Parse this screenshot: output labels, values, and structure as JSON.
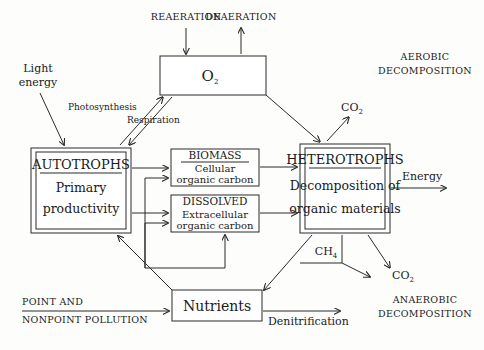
{
  "diagram": {
    "boxes": {
      "oxygen": {
        "label": "O",
        "subscript": "2"
      },
      "autotrophs": {
        "title": "AUTOTROPHS",
        "line1": "Primary",
        "line2": "productivity"
      },
      "biomass": {
        "title": "BIOMASS",
        "line1": "Cellular",
        "line2": "organic carbon"
      },
      "dissolved": {
        "title": "DISSOLVED",
        "line1": "Extracellular",
        "line2": "organic carbon"
      },
      "heterotrophs": {
        "title": "HETEROTROPHS",
        "line1": "Decomposition of",
        "line2": "organic materials"
      },
      "nutrients": {
        "label": "Nutrients"
      }
    },
    "flow_labels": {
      "reaeration": "REAERATION",
      "deaeration": "DEAERATION",
      "photosynthesis": "Photosynthesis",
      "respiration": "Respiration",
      "light_energy_line1": "Light",
      "light_energy_line2": "energy",
      "energy": "Energy",
      "denitrification": "Denitrification",
      "pollution_line1": "POINT AND",
      "pollution_line2": "NONPOINT POLLUTION"
    },
    "compounds": {
      "co2_top": {
        "label": "CO",
        "subscript": "2"
      },
      "co2_bottom": {
        "label": "CO",
        "subscript": "2"
      },
      "ch4": {
        "label": "CH",
        "subscript": "4"
      }
    },
    "zones": {
      "aerobic_line1": "AEROBIC",
      "aerobic_line2": "DECOMPOSITION",
      "anaerobic_line1": "ANAEROBIC",
      "anaerobic_line2": "DECOMPOSITION"
    },
    "colors": {
      "ink": "#2b2b2b",
      "paper": "#fdfdfc"
    }
  }
}
